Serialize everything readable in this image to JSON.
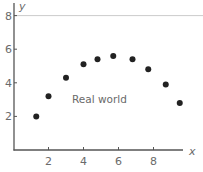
{
  "chart_data": {
    "type": "scatter",
    "title": "",
    "xlabel": "x",
    "ylabel": "y",
    "xlim": [
      0,
      10
    ],
    "ylim": [
      0,
      8
    ],
    "x_ticks": [
      2,
      4,
      6,
      8
    ],
    "y_ticks": [
      2,
      4,
      6,
      8
    ],
    "grid": false,
    "reference_line": {
      "axis": "y",
      "value": 8
    },
    "annotations": [
      {
        "text": "Real world",
        "x": 5.7,
        "y": 2.8
      }
    ],
    "series": [
      {
        "name": "Real world",
        "marker": "filled-circle",
        "color": "#222222",
        "x": [
          1.3,
          2.0,
          3.0,
          4.0,
          4.8,
          5.7,
          6.8,
          7.7,
          8.7,
          9.5
        ],
        "y": [
          2.0,
          3.2,
          4.3,
          5.1,
          5.4,
          5.6,
          5.4,
          4.8,
          3.9,
          2.8
        ]
      }
    ]
  },
  "axis_color": "#555555",
  "reference_line_color": "#cccccc",
  "point_color": "#222222"
}
